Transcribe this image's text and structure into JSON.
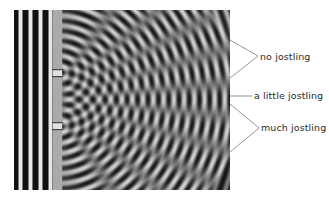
{
  "figure": {
    "labels": [
      {
        "id": "no",
        "text": "no jostling"
      },
      {
        "id": "little",
        "text": "a little jostling"
      },
      {
        "id": "much",
        "text": "much jostling"
      }
    ]
  },
  "colors": {
    "background": "#ffffff",
    "wave_dark": "#111111",
    "wave_light": "#f0f0f0",
    "barrier": "#a8a8a8",
    "leader_line": "#8a8a8a",
    "label_text": "#2a2a2a"
  }
}
